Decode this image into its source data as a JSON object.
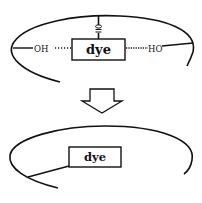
{
  "diagram": {
    "top": {
      "box_label": "dye",
      "left_group": "OH",
      "right_group": "HO",
      "top_group_glyph": "sulfonate-like substituent"
    },
    "arrow": {
      "direction": "down"
    },
    "bottom": {
      "box_label": "dye"
    }
  },
  "colors": {
    "ink": "#111111",
    "background": "#ffffff"
  }
}
